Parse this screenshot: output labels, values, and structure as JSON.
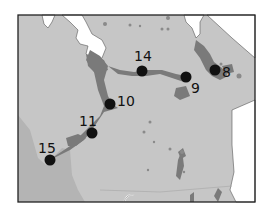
{
  "map": {
    "colors": {
      "land": "#c6c6c6",
      "land_dark_region": "#b4b4b4",
      "water": "#ffffff",
      "wetland": "#7a7a7a",
      "frame": "#222222",
      "marker": "#111111"
    },
    "markers": [
      {
        "id": "14",
        "label": "14",
        "x": 142,
        "y": 71,
        "label_x": 134,
        "label_y": 61
      },
      {
        "id": "9",
        "label": "9",
        "x": 186,
        "y": 77,
        "label_x": 191,
        "label_y": 92
      },
      {
        "id": "8",
        "label": "8",
        "x": 215,
        "y": 70,
        "label_x": 222,
        "label_y": 76
      },
      {
        "id": "10",
        "label": "10",
        "x": 110,
        "y": 104,
        "label_x": 117,
        "label_y": 106
      },
      {
        "id": "11",
        "label": "11",
        "x": 92,
        "y": 133,
        "label_x": 79,
        "label_y": 125
      },
      {
        "id": "15",
        "label": "15",
        "x": 50,
        "y": 160,
        "label_x": 38,
        "label_y": 153
      }
    ]
  }
}
